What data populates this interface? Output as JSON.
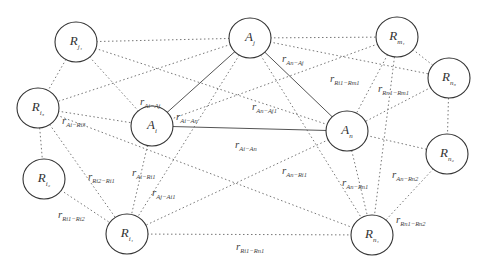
{
  "diagram": {
    "type": "network-graph",
    "nodes": [
      {
        "id": "Rj1",
        "base": "R",
        "sub": "j₁",
        "x": 76,
        "y": 42
      },
      {
        "id": "Aj",
        "base": "A",
        "sub": "j",
        "x": 250,
        "y": 38
      },
      {
        "id": "Rm1",
        "base": "R",
        "sub": "m₁",
        "x": 397,
        "y": 37
      },
      {
        "id": "Rn3",
        "base": "R",
        "sub": "n₃",
        "x": 449,
        "y": 78
      },
      {
        "id": "Ri3",
        "base": "R",
        "sub": "i₃",
        "x": 38,
        "y": 108
      },
      {
        "id": "Ai",
        "base": "A",
        "sub": "i",
        "x": 152,
        "y": 126
      },
      {
        "id": "An",
        "base": "A",
        "sub": "n",
        "x": 347,
        "y": 131
      },
      {
        "id": "Rn2",
        "base": "R",
        "sub": "n₂",
        "x": 447,
        "y": 154
      },
      {
        "id": "Ri2",
        "base": "R",
        "sub": "i₂",
        "x": 44,
        "y": 179
      },
      {
        "id": "Ri1",
        "base": "R",
        "sub": "i₁",
        "x": 127,
        "y": 234
      },
      {
        "id": "Rn1",
        "base": "R",
        "sub": "n₁",
        "x": 372,
        "y": 235
      }
    ],
    "solid_edges": [
      [
        "Aj",
        "Ai"
      ],
      [
        "Aj",
        "An"
      ],
      [
        "Ai",
        "An"
      ]
    ],
    "dotted_edges": [
      [
        "Rj1",
        "Aj"
      ],
      [
        "Rj1",
        "Ri3"
      ],
      [
        "Rj1",
        "Ai"
      ],
      [
        "Rj1",
        "An"
      ],
      [
        "Aj",
        "Rm1"
      ],
      [
        "Aj",
        "Rn3"
      ],
      [
        "Aj",
        "Ri3"
      ],
      [
        "Aj",
        "Ri1"
      ],
      [
        "Aj",
        "Rn1"
      ],
      [
        "Rm1",
        "Rn3"
      ],
      [
        "Rm1",
        "An"
      ],
      [
        "Rm1",
        "Ai"
      ],
      [
        "Rm1",
        "Rn1"
      ],
      [
        "Rn3",
        "An"
      ],
      [
        "Rn3",
        "Rn2"
      ],
      [
        "Ri3",
        "Ai"
      ],
      [
        "Ri3",
        "Ri2"
      ],
      [
        "Ri3",
        "Ri1"
      ],
      [
        "Ri3",
        "Rn1"
      ],
      [
        "Ai",
        "Ri1"
      ],
      [
        "An",
        "Rn2"
      ],
      [
        "An",
        "Ri1"
      ],
      [
        "An",
        "Rn1"
      ],
      [
        "Rn2",
        "Rn1"
      ],
      [
        "Ri2",
        "Ri1"
      ],
      [
        "Ri1",
        "Rn1"
      ]
    ],
    "edge_labels": [
      {
        "base": "r",
        "sub": "Ai−Aj",
        "x": 140,
        "y": 95
      },
      {
        "base": "r",
        "sub": "Ai−An",
        "x": 176,
        "y": 110
      },
      {
        "base": "r",
        "sub": "An−Aj",
        "x": 282,
        "y": 52
      },
      {
        "base": "r",
        "sub": "Ri1−Rm1",
        "x": 330,
        "y": 72
      },
      {
        "base": "r",
        "sub": "Rn1−Rm1",
        "x": 378,
        "y": 82
      },
      {
        "base": "r",
        "sub": "An−Aj1",
        "x": 252,
        "y": 100
      },
      {
        "base": "r",
        "sub": "Ai−Ri3",
        "x": 62,
        "y": 114
      },
      {
        "base": "r",
        "sub": "Ai−An",
        "x": 235,
        "y": 138
      },
      {
        "base": "r",
        "sub": "Ri2−Ri1",
        "x": 88,
        "y": 170
      },
      {
        "base": "r",
        "sub": "Ai−Ri1",
        "x": 132,
        "y": 166
      },
      {
        "base": "r",
        "sub": "Aj−Ai1",
        "x": 152,
        "y": 186
      },
      {
        "base": "r",
        "sub": "An−Ri1",
        "x": 282,
        "y": 164
      },
      {
        "base": "r",
        "sub": "An−Rn1",
        "x": 342,
        "y": 176
      },
      {
        "base": "r",
        "sub": "An−Rn2",
        "x": 392,
        "y": 168
      },
      {
        "base": "r",
        "sub": "Ri1−Ri2",
        "x": 58,
        "y": 208
      },
      {
        "base": "r",
        "sub": "Rn1−Rn2",
        "x": 396,
        "y": 213
      },
      {
        "base": "r",
        "sub": "Ri1−Rn1",
        "x": 236,
        "y": 240
      }
    ]
  }
}
